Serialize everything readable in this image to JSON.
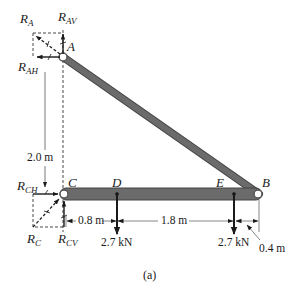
{
  "figure": {
    "caption": "(a)",
    "colors": {
      "member": "#6b6b6b",
      "member_edge": "#444444",
      "ink": "#1a1a1a",
      "dashed": "#333333",
      "pin_fill": "#ffffff"
    },
    "points": {
      "A": {
        "label": "A"
      },
      "B": {
        "label": "B"
      },
      "C": {
        "label": "C"
      },
      "D": {
        "label": "D"
      },
      "E": {
        "label": "E"
      }
    },
    "reactions": {
      "RA": {
        "main": "R",
        "sub": "A"
      },
      "RAV": {
        "main": "R",
        "sub": "AV"
      },
      "RAH": {
        "main": "R",
        "sub": "AH"
      },
      "RC": {
        "main": "R",
        "sub": "C"
      },
      "RCV": {
        "main": "R",
        "sub": "CV"
      },
      "RCH": {
        "main": "R",
        "sub": "CH"
      }
    },
    "loads": [
      {
        "point": "D",
        "label": "2.7 kN"
      },
      {
        "point": "E",
        "label": "2.7 kN"
      }
    ],
    "dimensions": {
      "height_AC": "2.0 m",
      "CD": "0.8 m",
      "DE": "1.8 m",
      "EB": "0.4 m"
    }
  }
}
